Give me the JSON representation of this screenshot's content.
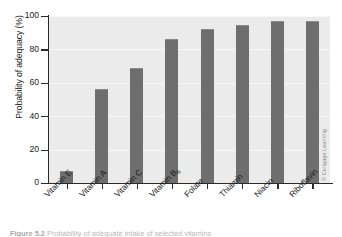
{
  "chart_data": {
    "type": "bar",
    "title": "",
    "xlabel": "",
    "ylabel": "Probability of adequacy (%)",
    "categories": [
      "Vitamin E",
      "Vitamin A",
      "Vitamin C",
      "Vitamin B6",
      "Folate",
      "Thiamin",
      "Niacin",
      "Riboflavin"
    ],
    "category_labels_html": [
      "Vitamin E",
      "Vitamin A",
      "Vitamin C",
      "Vitamin B<sub>6</sub>",
      "Folate",
      "Thiamin",
      "Niacin",
      "Riboflavin"
    ],
    "values": [
      7,
      56,
      69,
      86,
      92,
      94.5,
      97,
      97
    ],
    "ylim": [
      0,
      100
    ],
    "yticks": [
      0,
      20,
      40,
      60,
      80,
      100
    ],
    "grid": true,
    "grid_axis": "y",
    "legend": "none",
    "bar_color": "#6e6e6e",
    "plot_background": "#ebebeb",
    "axis_color": "#2b2b2b"
  },
  "credit": "© Cengage Learning",
  "caption": {
    "number": "Figure 5.2",
    "text": "Probability of adequate intake of selected vitamins"
  }
}
